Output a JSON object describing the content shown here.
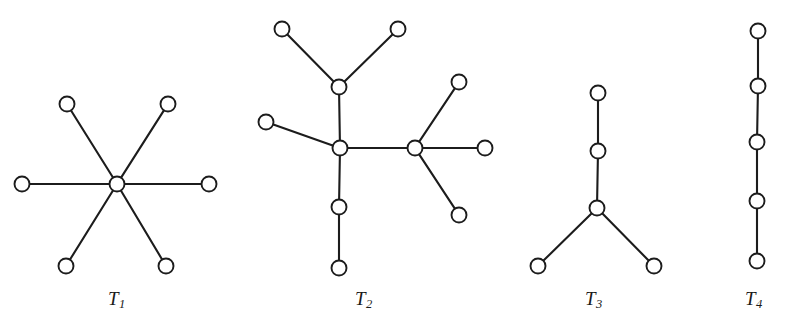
{
  "figure": {
    "type": "graph-diagram",
    "background_color": "#ffffff",
    "stroke_color": "#1c1c1c",
    "node_fill_color": "#ffffff",
    "width": 790,
    "height": 327
  },
  "trees": [
    {
      "id": "T1",
      "label_text": "T",
      "label_sub": "1",
      "label_x": 108,
      "label_y": 288,
      "node_count": 7,
      "edge_count": 6,
      "shape": "star",
      "nodes": [
        {
          "name": "center",
          "x": 117,
          "y": 184,
          "r": 7.5
        },
        {
          "name": "leaf-top-left",
          "x": 67,
          "y": 104,
          "r": 7.5
        },
        {
          "name": "leaf-top-right",
          "x": 168,
          "y": 104,
          "r": 7.5
        },
        {
          "name": "leaf-left",
          "x": 22,
          "y": 184,
          "r": 7.5
        },
        {
          "name": "leaf-right",
          "x": 209,
          "y": 184,
          "r": 7.5
        },
        {
          "name": "leaf-bottom-left",
          "x": 66,
          "y": 266,
          "r": 7.5
        },
        {
          "name": "leaf-bottom-right",
          "x": 166,
          "y": 266,
          "r": 7.5
        }
      ],
      "edges": [
        [
          0,
          1
        ],
        [
          0,
          2
        ],
        [
          0,
          3
        ],
        [
          0,
          4
        ],
        [
          0,
          5
        ],
        [
          0,
          6
        ]
      ]
    },
    {
      "id": "T2",
      "label_text": "T",
      "label_sub": "2",
      "label_x": 355,
      "label_y": 288,
      "node_count": 11,
      "edge_count": 10,
      "shape": "branched",
      "nodes": [
        {
          "name": "hub-left",
          "x": 340,
          "y": 148,
          "r": 7.5
        },
        {
          "name": "hub-right",
          "x": 415,
          "y": 148,
          "r": 7.5
        },
        {
          "name": "upper-fork",
          "x": 339,
          "y": 87,
          "r": 7.5
        },
        {
          "name": "leaf-top-left",
          "x": 282,
          "y": 29,
          "r": 7.5
        },
        {
          "name": "leaf-top-right",
          "x": 398,
          "y": 29,
          "r": 7.5
        },
        {
          "name": "leaf-west",
          "x": 266,
          "y": 122,
          "r": 7.5
        },
        {
          "name": "mid-lower",
          "x": 339,
          "y": 207,
          "r": 7.5
        },
        {
          "name": "leaf-bottom",
          "x": 339,
          "y": 268,
          "r": 7.5
        },
        {
          "name": "leaf-upper-right",
          "x": 459,
          "y": 82,
          "r": 7.5
        },
        {
          "name": "leaf-east",
          "x": 485,
          "y": 148,
          "r": 7.5
        },
        {
          "name": "leaf-lower-right",
          "x": 459,
          "y": 215,
          "r": 7.5
        }
      ],
      "edges": [
        [
          0,
          1
        ],
        [
          0,
          2
        ],
        [
          2,
          3
        ],
        [
          2,
          4
        ],
        [
          0,
          5
        ],
        [
          0,
          6
        ],
        [
          6,
          7
        ],
        [
          1,
          8
        ],
        [
          1,
          9
        ],
        [
          1,
          10
        ]
      ]
    },
    {
      "id": "T3",
      "label_text": "T",
      "label_sub": "3",
      "label_x": 585,
      "label_y": 288,
      "node_count": 5,
      "edge_count": 4,
      "shape": "Y-path",
      "nodes": [
        {
          "name": "top",
          "x": 598,
          "y": 93,
          "r": 7.5
        },
        {
          "name": "upper-middle",
          "x": 598,
          "y": 151,
          "r": 7.5
        },
        {
          "name": "fork",
          "x": 597,
          "y": 208,
          "r": 7.5
        },
        {
          "name": "leaf-bottom-left",
          "x": 538,
          "y": 266,
          "r": 7.5
        },
        {
          "name": "leaf-bottom-right",
          "x": 654,
          "y": 266,
          "r": 7.5
        }
      ],
      "edges": [
        [
          0,
          1
        ],
        [
          1,
          2
        ],
        [
          2,
          3
        ],
        [
          2,
          4
        ]
      ]
    },
    {
      "id": "T4",
      "label_text": "T",
      "label_sub": "4",
      "label_x": 745,
      "label_y": 288,
      "node_count": 5,
      "edge_count": 4,
      "shape": "path",
      "nodes": [
        {
          "name": "node-1",
          "x": 758,
          "y": 31,
          "r": 7.5
        },
        {
          "name": "node-2",
          "x": 758,
          "y": 86,
          "r": 7.5
        },
        {
          "name": "node-3",
          "x": 757,
          "y": 142,
          "r": 7.5
        },
        {
          "name": "node-4",
          "x": 757,
          "y": 201,
          "r": 7.5
        },
        {
          "name": "node-5",
          "x": 757,
          "y": 261,
          "r": 7.5
        }
      ],
      "edges": [
        [
          0,
          1
        ],
        [
          1,
          2
        ],
        [
          2,
          3
        ],
        [
          3,
          4
        ]
      ]
    }
  ]
}
